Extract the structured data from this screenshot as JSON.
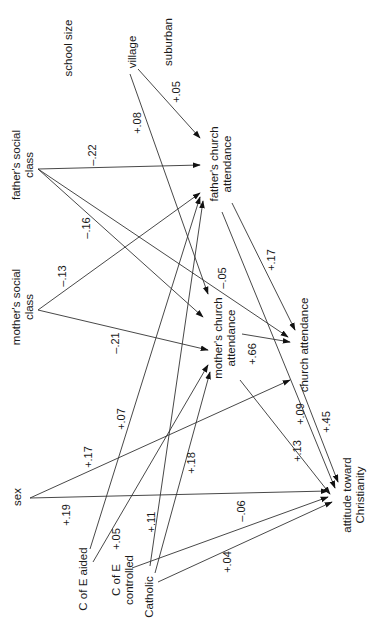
{
  "diagram": {
    "orientation": "rotated 90 degrees counter-clockwise",
    "nodes": {
      "school_size": "school size",
      "suburban": "suburban",
      "village": "village",
      "fathers_social_class_1": "father's social",
      "fathers_social_class_2": "class",
      "mothers_social_class_1": "mother's social",
      "mothers_social_class_2": "class",
      "sex": "sex",
      "c_of_e_aided": "C of E aided",
      "c_of_e_controlled_1": "C of E",
      "c_of_e_controlled_2": "controlled",
      "catholic": "Catholic",
      "fathers_church_attendance_1": "father's church",
      "fathers_church_attendance_2": "attendance",
      "mothers_church_attendance_1": "mother's church",
      "mothers_church_attendance_2": "attendance",
      "church_attendance": "church attendance",
      "attitude_1": "attitude toward",
      "attitude_2": "Christianity"
    },
    "coefficients": {
      "village_to_fathers_church": "+.05",
      "village_to_mothers_church": "+.08",
      "fathers_class_to_fathers_church": "–.22",
      "fathers_class_to_mothers_church": "–.16",
      "fathers_class_to_church_attendance": "–.05",
      "mothers_class_to_fathers_church": "–.13",
      "mothers_class_to_mothers_church": "–.21",
      "fathers_church_to_church_attendance": "+.17",
      "fathers_church_to_attitude": "+.45",
      "mothers_church_to_church_attendance": "+.66",
      "mothers_church_to_attitude": "+.13",
      "church_attendance_to_attitude": "+.09",
      "sex_to_church_attendance": "+.17",
      "sex_to_attitude": "+.19",
      "c_of_e_aided_to_fathers_church": "+.07",
      "c_of_e_aided_to_mothers_church": "+.05",
      "c_of_e_controlled_to_fathers_church": "+.11",
      "catholic_to_mothers_church": "+.18",
      "c_of_e_controlled_to_attitude": "–.06",
      "catholic_to_attitude": "+.04"
    }
  }
}
